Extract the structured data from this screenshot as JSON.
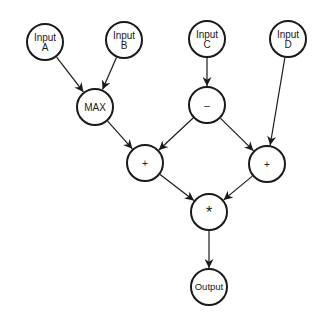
{
  "diagram": {
    "type": "computation-graph",
    "node_radius": 18,
    "stroke_color": "#1a1a1a",
    "background": "#ffffff",
    "nodes": [
      {
        "id": "inputA",
        "lines": [
          "Input",
          "A"
        ],
        "x": 45,
        "y": 42
      },
      {
        "id": "inputB",
        "lines": [
          "Input",
          "B"
        ],
        "x": 124,
        "y": 40
      },
      {
        "id": "inputC",
        "lines": [
          "Input",
          "C"
        ],
        "x": 207,
        "y": 39
      },
      {
        "id": "inputD",
        "lines": [
          "Input",
          "D"
        ],
        "x": 288,
        "y": 39
      },
      {
        "id": "max",
        "lines": [
          "MAX"
        ],
        "x": 95,
        "y": 107
      },
      {
        "id": "minus",
        "lines": [
          "–"
        ],
        "x": 207,
        "y": 105
      },
      {
        "id": "plusLeft",
        "lines": [
          "+"
        ],
        "x": 145,
        "y": 163
      },
      {
        "id": "plusRight",
        "lines": [
          "+"
        ],
        "x": 267,
        "y": 164
      },
      {
        "id": "multiply",
        "lines": [
          "*"
        ],
        "x": 209,
        "y": 212
      },
      {
        "id": "output",
        "lines": [
          "Output"
        ],
        "x": 209,
        "y": 287
      }
    ],
    "edges": [
      {
        "from": "inputA",
        "to": "max"
      },
      {
        "from": "inputB",
        "to": "max"
      },
      {
        "from": "inputC",
        "to": "minus"
      },
      {
        "from": "max",
        "to": "plusLeft"
      },
      {
        "from": "minus",
        "to": "plusLeft"
      },
      {
        "from": "minus",
        "to": "plusRight"
      },
      {
        "from": "inputD",
        "to": "plusRight"
      },
      {
        "from": "plusLeft",
        "to": "multiply"
      },
      {
        "from": "plusRight",
        "to": "multiply"
      },
      {
        "from": "multiply",
        "to": "output"
      }
    ]
  }
}
